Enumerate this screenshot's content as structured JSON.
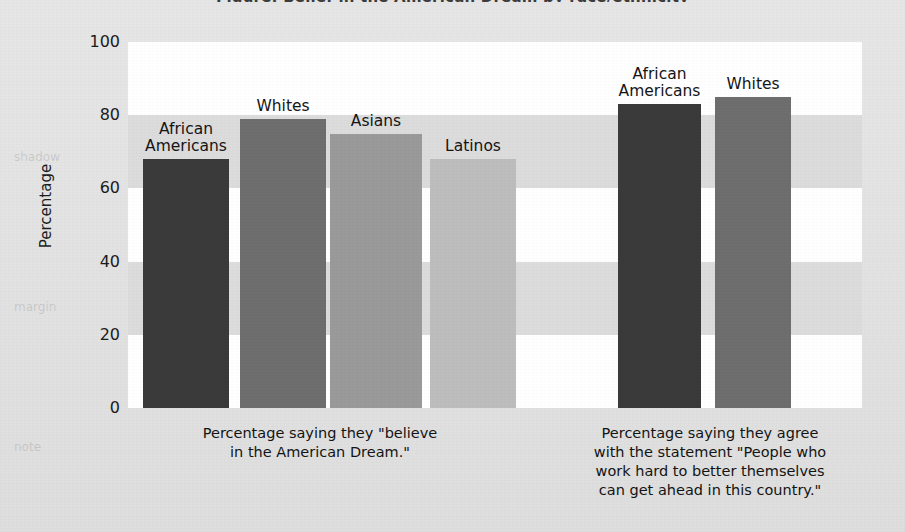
{
  "figure": {
    "title_remnant": "Figure: Belief in the American Dream by race/ethnicity",
    "background_color": "#e3e3e3",
    "plot_background_color": "#ffffff",
    "band_color": "#dcdcdc"
  },
  "chart_data": {
    "type": "bar",
    "title": "",
    "xlabel": "",
    "ylabel": "Percentage",
    "ylim": [
      0,
      100
    ],
    "yticks": [
      0,
      20,
      40,
      60,
      80,
      100
    ],
    "ytick_labels": [
      "0",
      "20",
      "40",
      "60",
      "80",
      "100"
    ],
    "grid": "horizontal alternating bands every 20 units",
    "legend": "none — bars labelled directly above each column",
    "groups": [
      {
        "id": "group-believe",
        "caption": "Percentage saying they \"believe\nin the American Dream.\"",
        "categories": [
          "African\nAmericans",
          "Whites",
          "Asians",
          "Latinos"
        ],
        "values": [
          68,
          79,
          75,
          68
        ],
        "colors": [
          "#3a3a3a",
          "#6e6e6e",
          "#9a9a9a",
          "#bdbdbd"
        ]
      },
      {
        "id": "group-work-hard",
        "caption": "Percentage saying they agree\nwith the statement \"People who\nwork hard to better themselves\ncan get ahead in this country.\"",
        "categories": [
          "African\nAmericans",
          "Whites"
        ],
        "values": [
          83,
          85
        ],
        "colors": [
          "#3a3a3a",
          "#6e6e6e"
        ]
      }
    ]
  },
  "labels": {
    "y_axis_title": "Percentage",
    "bar_african_americans": "African\nAmericans",
    "bar_whites": "Whites",
    "bar_asians": "Asians",
    "bar_latinos": "Latinos",
    "caption_believe": "Percentage saying they \"believe\nin the American Dream.\"",
    "caption_work_hard": "Percentage saying they agree\nwith the statement \"People who\nwork hard to better themselves\ncan get ahead in this country.\""
  }
}
